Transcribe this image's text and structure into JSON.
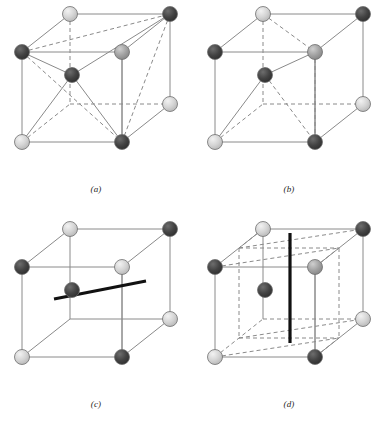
{
  "figure": {
    "type": "crystal-structure-diagram",
    "panel_count": 4,
    "colors": {
      "dark_sphere": "#3a3a3a",
      "medium_sphere": "#9a9a9a",
      "light_sphere": "#cfcfcf",
      "sphere_outline": "#6e6e6e",
      "edge_solid": "#8a8a8a",
      "edge_dashed": "#8a8a8a",
      "bold_axis": "#111111",
      "background": "#ffffff",
      "caption_text": "#262626"
    },
    "geometry": {
      "front_top_left": [
        22,
        52
      ],
      "front_top_right": [
        122,
        52
      ],
      "front_bottom_left": [
        22,
        142
      ],
      "front_bottom_right": [
        122,
        142
      ],
      "back_offset_x": 48,
      "back_offset_y": -38,
      "sphere_radius": 7.5
    }
  },
  "panels": [
    {
      "id": "a",
      "caption": "(a)",
      "sphere_count": 9,
      "has_bold_axis": false,
      "bold_axis_type": "none",
      "interior_dashed_grid": false,
      "spheres": [
        {
          "name": "back-top-left",
          "x": 70,
          "y": 14,
          "shade": "light"
        },
        {
          "name": "back-top-right",
          "x": 170,
          "y": 14,
          "shade": "dark"
        },
        {
          "name": "front-top-left",
          "x": 22,
          "y": 52,
          "shade": "dark"
        },
        {
          "name": "front-top-right",
          "x": 122,
          "y": 52,
          "shade": "medium"
        },
        {
          "name": "body-centre",
          "x": 72,
          "y": 75,
          "shade": "dark"
        },
        {
          "name": "back-bottom-right",
          "x": 170,
          "y": 104,
          "shade": "light"
        },
        {
          "name": "front-bottom-left",
          "x": 22,
          "y": 142,
          "shade": "light"
        },
        {
          "name": "front-bottom-right",
          "x": 122,
          "y": 142,
          "shade": "dark"
        },
        {
          "name": "back-bottom-left",
          "x": 70,
          "y": 104,
          "shade": "hidden"
        }
      ],
      "diagonals": [
        {
          "from": "front-top-left",
          "to": "front-bottom-right",
          "style": "dashed"
        },
        {
          "from": "front-top-left",
          "to": "back-top-right",
          "style": "dashed"
        },
        {
          "from": "back-top-right",
          "to": "front-bottom-right",
          "style": "dashed"
        },
        {
          "from": "back-top-right",
          "to": "body-centre",
          "style": "solid"
        },
        {
          "from": "front-top-left",
          "to": "body-centre",
          "style": "solid"
        },
        {
          "from": "front-bottom-left",
          "to": "body-centre",
          "style": "solid"
        },
        {
          "from": "front-bottom-right",
          "to": "body-centre",
          "style": "solid"
        }
      ]
    },
    {
      "id": "b",
      "caption": "(b)",
      "sphere_count": 9,
      "has_bold_axis": false,
      "bold_axis_type": "none",
      "interior_dashed_grid": false,
      "spheres": [
        {
          "name": "back-top-left",
          "x": 70,
          "y": 14,
          "shade": "light"
        },
        {
          "name": "back-top-right",
          "x": 170,
          "y": 14,
          "shade": "dark"
        },
        {
          "name": "front-top-left",
          "x": 22,
          "y": 52,
          "shade": "dark"
        },
        {
          "name": "front-top-right",
          "x": 122,
          "y": 52,
          "shade": "medium"
        },
        {
          "name": "body-centre",
          "x": 72,
          "y": 75,
          "shade": "dark"
        },
        {
          "name": "back-bottom-right",
          "x": 170,
          "y": 104,
          "shade": "light"
        },
        {
          "name": "front-bottom-left",
          "x": 22,
          "y": 142,
          "shade": "light"
        },
        {
          "name": "front-bottom-right",
          "x": 122,
          "y": 142,
          "shade": "dark"
        },
        {
          "name": "back-bottom-left",
          "x": 70,
          "y": 104,
          "shade": "hidden"
        }
      ],
      "diagonals": [
        {
          "from": "back-top-left",
          "to": "back-bottom-left",
          "style": "dashed"
        },
        {
          "from": "back-top-left",
          "to": "front-top-right",
          "style": "dashed"
        },
        {
          "from": "front-top-right",
          "to": "front-bottom-right",
          "style": "dashed"
        },
        {
          "from": "body-centre",
          "to": "front-bottom-right",
          "style": "dashed"
        },
        {
          "from": "body-centre",
          "to": "front-top-right",
          "style": "solid"
        },
        {
          "from": "body-centre",
          "to": "front-bottom-left",
          "style": "solid"
        }
      ]
    },
    {
      "id": "c",
      "caption": "(c)",
      "sphere_count": 9,
      "has_bold_axis": true,
      "bold_axis_type": "horizontal-two-fold-axis",
      "bold_axis": {
        "x1": 54,
        "y1": 84,
        "x2": 146,
        "y2": 66
      },
      "interior_dashed_grid": false,
      "spheres": [
        {
          "name": "back-top-left",
          "x": 70,
          "y": 14,
          "shade": "light"
        },
        {
          "name": "back-top-right",
          "x": 170,
          "y": 14,
          "shade": "dark"
        },
        {
          "name": "front-top-left",
          "x": 22,
          "y": 52,
          "shade": "dark"
        },
        {
          "name": "front-top-right",
          "x": 122,
          "y": 52,
          "shade": "light"
        },
        {
          "name": "body-centre",
          "x": 72,
          "y": 75,
          "shade": "dark"
        },
        {
          "name": "back-bottom-right",
          "x": 170,
          "y": 104,
          "shade": "light"
        },
        {
          "name": "front-bottom-left",
          "x": 22,
          "y": 142,
          "shade": "light"
        },
        {
          "name": "front-bottom-right",
          "x": 122,
          "y": 142,
          "shade": "dark"
        },
        {
          "name": "back-bottom-left",
          "x": 70,
          "y": 104,
          "shade": "hidden"
        }
      ],
      "diagonals": []
    },
    {
      "id": "d",
      "caption": "(d)",
      "sphere_count": 9,
      "has_bold_axis": true,
      "bold_axis_type": "vertical-four-fold-axis",
      "bold_axis": {
        "x1": 97,
        "y1": 18,
        "x2": 97,
        "y2": 128
      },
      "interior_dashed_grid": true,
      "spheres": [
        {
          "name": "back-top-left",
          "x": 70,
          "y": 14,
          "shade": "light"
        },
        {
          "name": "back-top-right",
          "x": 170,
          "y": 14,
          "shade": "dark"
        },
        {
          "name": "front-top-left",
          "x": 22,
          "y": 52,
          "shade": "dark"
        },
        {
          "name": "front-top-right",
          "x": 122,
          "y": 52,
          "shade": "medium"
        },
        {
          "name": "body-centre",
          "x": 72,
          "y": 75,
          "shade": "dark"
        },
        {
          "name": "back-bottom-right",
          "x": 170,
          "y": 104,
          "shade": "light"
        },
        {
          "name": "front-bottom-left",
          "x": 22,
          "y": 142,
          "shade": "light"
        },
        {
          "name": "front-bottom-right",
          "x": 122,
          "y": 142,
          "shade": "dark"
        },
        {
          "name": "back-bottom-left",
          "x": 70,
          "y": 104,
          "shade": "hidden"
        }
      ],
      "diagonals": []
    }
  ]
}
